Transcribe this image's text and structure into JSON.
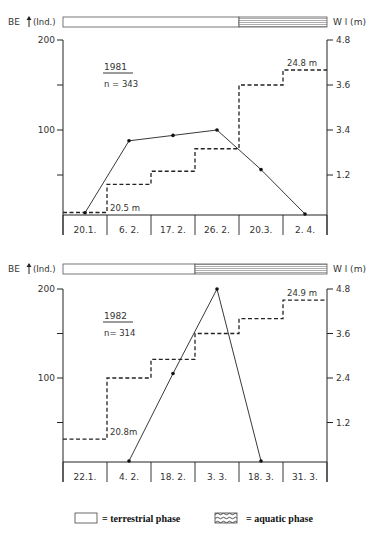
{
  "chart_data": [
    {
      "type": "line",
      "title": "1981",
      "subtitle": "n=343",
      "ylabel_left": "BE (Ind.)",
      "ylabel_right": "Wl (m)",
      "categories": [
        "20.1.",
        "6. 2.",
        "17. 2.",
        "26. 2.",
        "20.3.",
        "2. 4."
      ],
      "ylim_left": [
        0,
        200
      ],
      "left_ticks": [
        "200",
        "",
        "100",
        ""
      ],
      "right_ticks": [
        "4.8",
        "3.6",
        "3.4",
        "1.2"
      ],
      "ylim_right": [
        0,
        4.8
      ],
      "phase_bar": {
        "terrestrial_columns": 4,
        "aquatic_columns": 2
      },
      "series": [
        {
          "name": "BE (individuals)",
          "style": "solid-with-points",
          "values": [
            8,
            88,
            94,
            100,
            56,
            6
          ]
        },
        {
          "name": "Water level (m)",
          "style": "dashed-step",
          "values": [
            0.2,
            0.95,
            1.3,
            1.9,
            3.6,
            4.0
          ]
        }
      ],
      "annotations": [
        "20.5 m",
        "24.8 m"
      ]
    },
    {
      "type": "line",
      "title": "1982",
      "subtitle": "n= 314",
      "ylabel_left": "BE (Ind.)",
      "ylabel_right": "Wl (m)",
      "categories": [
        "22.1.",
        "4. 2.",
        "18. 2.",
        "3. 3.",
        "18. 3.",
        "31. 3."
      ],
      "ylim_left": [
        0,
        200
      ],
      "left_ticks": [
        "200",
        "",
        "100",
        ""
      ],
      "right_ticks": [
        "4.8",
        "3.6",
        "2.4",
        "1.2"
      ],
      "ylim_right": [
        0,
        4.8
      ],
      "phase_bar": {
        "terrestrial_columns": 3,
        "aquatic_columns": 3
      },
      "series": [
        {
          "name": "BE (individuals)",
          "style": "solid-with-points",
          "categories_index": [
            1,
            2,
            3,
            4
          ],
          "values": [
            0,
            105,
            200,
            0
          ]
        },
        {
          "name": "Water level (m)",
          "style": "dashed-step",
          "values": [
            0.75,
            2.4,
            2.9,
            3.6,
            4.0,
            4.5
          ]
        }
      ],
      "annotations": [
        "20.8m",
        "24.9 m"
      ]
    }
  ],
  "charts": [
    {
      "year": "1981",
      "n": "n = 343",
      "be_label": "BE",
      "ind_label": "(Ind.)",
      "wl_label": "W l (m)",
      "left_top": "200",
      "left_mid": "100",
      "right_ticks": [
        "4.8",
        "3.6",
        "3.4",
        "1.2"
      ],
      "cats": [
        "20.1.",
        "6. 2.",
        "17. 2.",
        "26. 2.",
        "20.3.",
        "2. 4."
      ],
      "start_level": "20.5 m",
      "end_level": "24.8 m"
    },
    {
      "year": "1982",
      "n": "n= 314",
      "be_label": "BE",
      "ind_label": "(Ind.)",
      "wl_label": "W l (m)",
      "left_top": "200",
      "left_mid": "100",
      "right_ticks": [
        "4.8",
        "3.6",
        "2.4",
        "1.2"
      ],
      "cats": [
        "22.1.",
        "4. 2.",
        "18. 2.",
        "3. 3.",
        "18. 3.",
        "31. 3."
      ],
      "start_level": "20.8m",
      "end_level": "24.9 m"
    }
  ],
  "legend": {
    "terrestrial": "= terrestrial phase",
    "aquatic": "= aquatic phase"
  }
}
